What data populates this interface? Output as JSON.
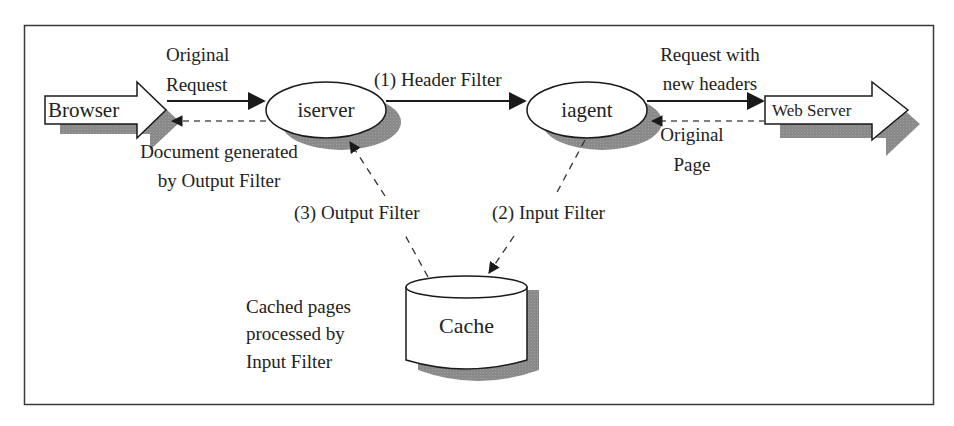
{
  "diagram": {
    "type": "architecture-flow",
    "nodes": {
      "browser": {
        "label": "Browser",
        "shape": "block-arrow-right"
      },
      "iserver": {
        "label": "iserver",
        "shape": "ellipse"
      },
      "iagent": {
        "label": "iagent",
        "shape": "ellipse"
      },
      "web_server": {
        "label": "Web Server",
        "shape": "block-arrow-right"
      },
      "cache": {
        "label": "Cache",
        "shape": "cylinder"
      }
    },
    "edges": {
      "original_request": {
        "from": "browser",
        "to": "iserver",
        "style": "solid",
        "label_line1": "Original",
        "label_line2": "Request"
      },
      "document_generated": {
        "from": "iserver",
        "to": "browser",
        "style": "dashed",
        "label_line1": "Document generated",
        "label_line2": "by Output Filter"
      },
      "header_filter": {
        "from": "iserver",
        "to": "iagent",
        "style": "solid",
        "label": "(1) Header Filter"
      },
      "request_new_headers": {
        "from": "iagent",
        "to": "web_server",
        "style": "solid",
        "label_line1": "Request with",
        "label_line2": "new headers"
      },
      "original_page": {
        "from": "web_server",
        "to": "iagent",
        "style": "dashed",
        "label_line1": "Original",
        "label_line2": "Page"
      },
      "input_filter": {
        "from": "iagent",
        "to": "cache",
        "style": "dashed",
        "label": "(2) Input Filter"
      },
      "output_filter": {
        "from": "cache",
        "to": "iserver",
        "style": "dashed",
        "label": "(3) Output Filter"
      }
    },
    "annotations": {
      "cache_note": {
        "line1": "Cached pages",
        "line2": "processed by",
        "line3": "Input Filter"
      }
    },
    "colors": {
      "stroke": "#1a1a1a",
      "fill": "#ffffff",
      "shadow": "#8c8c8c",
      "frame": "#3a3a3a"
    }
  }
}
